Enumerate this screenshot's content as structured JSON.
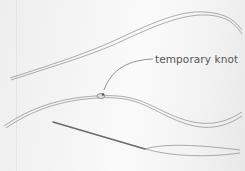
{
  "image": {
    "description": "Illustration of threads laid on fabric showing a temporary knot and a needle with thread",
    "annotation": {
      "label": "temporary knot"
    }
  }
}
